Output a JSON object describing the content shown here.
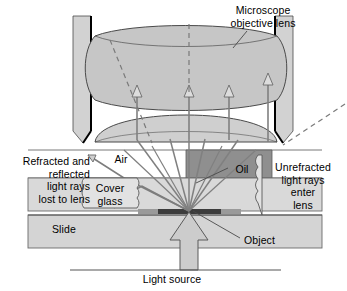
{
  "figure": {
    "background_color": "#ffffff",
    "width": 347,
    "height": 291
  },
  "labels": {
    "title": "Microscope\nobjective lens",
    "refracted_lost": "Refracted and\nreflected\nlight rays\nlost to lens",
    "air": "Air",
    "oil": "Oil",
    "unrefracted": "Unrefracted\nlight rays\nenter\nlens",
    "cover_glass": "Cover\nglass",
    "slide": "Slide",
    "object": "Object",
    "light_source": "Light source"
  },
  "colors": {
    "outline": "#3a3a3a",
    "barrel_fill": "#d2d2d2",
    "barrel_inner_edge": "#000000",
    "lens_fill": "#c6c6c6",
    "lens_lower_fill": "#cfcfcf",
    "oil_fill": "#8f8f8f",
    "cover_glass_fill": "#d9d9d9",
    "slide_fill": "#d4d4d4",
    "object_fill": "#3c3c3c",
    "ray_color": "#808080",
    "ray_dark": "#6e6e6e",
    "dashed_ray": "#7a7a7a",
    "leader_line": "#4a4a4a",
    "callout_fill": "#e2e2e2",
    "light_arrow_fill": "#cccccc",
    "text": "#000000"
  },
  "elements": {
    "barrel_left": "objective-barrel-left-wall",
    "barrel_right": "objective-barrel-right-wall",
    "lens_upper": "objective-lens-upper-element",
    "lens_lower": "objective-lens-lower-element",
    "oil_layer": "immersion-oil-layer",
    "cover_glass_layer": "cover-glass-layer",
    "slide_layer": "microscope-slide",
    "object_specimen": "specimen-object",
    "light_source_arrow": "light-source-arrow",
    "light_source_baseline": "light-source-baseline"
  },
  "rays": {
    "entering_count": 4,
    "lost_count": 2,
    "dashed_count": 3,
    "from_object_count": 9,
    "description": "Rays from the object pass through oil into the lens without refraction; rays through air at the left are refracted and reflected away, lost to the lens."
  }
}
